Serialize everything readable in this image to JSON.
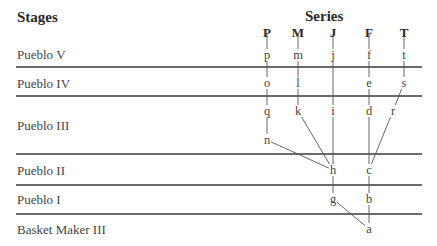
{
  "headers": {
    "stages": "Stages",
    "series": "Series"
  },
  "stages": [
    {
      "label": "Pueblo V",
      "y": 55
    },
    {
      "label": "Pueblo IV",
      "y": 84
    },
    {
      "label": "Pueblo III",
      "y": 126
    },
    {
      "label": "Pueblo II",
      "y": 171
    },
    {
      "label": "Pueblo I",
      "y": 200
    },
    {
      "label": "Basket Maker III",
      "y": 230
    }
  ],
  "series": [
    {
      "label": "P",
      "x": 267
    },
    {
      "label": "M",
      "x": 298
    },
    {
      "label": "J",
      "x": 333
    },
    {
      "label": "F",
      "x": 369
    },
    {
      "label": "T",
      "x": 404
    }
  ],
  "dividers": [
    67,
    96,
    154,
    185,
    214
  ],
  "nodes": {
    "p": {
      "label": "p",
      "x": 267,
      "y": 55
    },
    "m": {
      "label": "m",
      "x": 298,
      "y": 55
    },
    "j": {
      "label": "j",
      "x": 333,
      "y": 55
    },
    "f": {
      "label": "f",
      "x": 369,
      "y": 55
    },
    "t": {
      "label": "t",
      "x": 404,
      "y": 55
    },
    "o": {
      "label": "o",
      "x": 267,
      "y": 83
    },
    "l": {
      "label": "l",
      "x": 298,
      "y": 83
    },
    "e": {
      "label": "e",
      "x": 369,
      "y": 83
    },
    "s": {
      "label": "s",
      "x": 404,
      "y": 83
    },
    "q": {
      "label": "q",
      "x": 267,
      "y": 111
    },
    "k": {
      "label": "k",
      "x": 298,
      "y": 111
    },
    "i": {
      "label": "i",
      "x": 333,
      "y": 111
    },
    "d": {
      "label": "d",
      "x": 369,
      "y": 111
    },
    "r": {
      "label": "r",
      "x": 393,
      "y": 111
    },
    "n": {
      "label": "n",
      "x": 267,
      "y": 140
    },
    "h": {
      "label": "h",
      "x": 333,
      "y": 170
    },
    "c": {
      "label": "c",
      "x": 369,
      "y": 170
    },
    "g": {
      "label": "g",
      "x": 333,
      "y": 199
    },
    "b": {
      "label": "b",
      "x": 369,
      "y": 199
    },
    "a": {
      "label": "a",
      "x": 369,
      "y": 229
    }
  },
  "edges": [
    [
      "P_hdr",
      "p"
    ],
    [
      "M_hdr",
      "m"
    ],
    [
      "J_hdr",
      "j"
    ],
    [
      "F_hdr",
      "f"
    ],
    [
      "T_hdr",
      "t"
    ],
    [
      "p",
      "o"
    ],
    [
      "o",
      "q"
    ],
    [
      "q",
      "n"
    ],
    [
      "n",
      "h"
    ],
    [
      "m",
      "l"
    ],
    [
      "l",
      "k"
    ],
    [
      "k",
      "h"
    ],
    [
      "j",
      "i"
    ],
    [
      "i",
      "h"
    ],
    [
      "f",
      "e"
    ],
    [
      "e",
      "d"
    ],
    [
      "d",
      "c"
    ],
    [
      "t",
      "s"
    ],
    [
      "s",
      "r"
    ],
    [
      "r",
      "c"
    ],
    [
      "h",
      "g"
    ],
    [
      "g",
      "a"
    ],
    [
      "c",
      "b"
    ],
    [
      "b",
      "a"
    ]
  ],
  "colors": {
    "line": "#3a3a3a",
    "text": "#444444"
  }
}
